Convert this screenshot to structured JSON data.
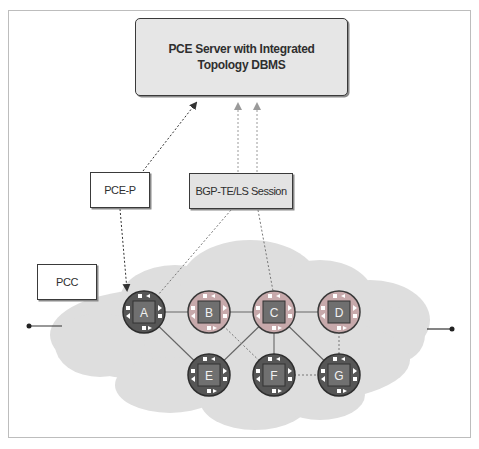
{
  "diagram": {
    "server": {
      "line1": "PCE Server with Integrated",
      "line2": "Topology DBMS"
    },
    "labels": {
      "pcep": "PCE-P",
      "bgp_session": "BGP-TE/LS Session",
      "pcc": "PCC"
    },
    "nodes": [
      {
        "id": "A",
        "label": "A",
        "style": "dark"
      },
      {
        "id": "B",
        "label": "B",
        "style": "light"
      },
      {
        "id": "C",
        "label": "C",
        "style": "light"
      },
      {
        "id": "D",
        "label": "D",
        "style": "light"
      },
      {
        "id": "E",
        "label": "E",
        "style": "dark"
      },
      {
        "id": "F",
        "label": "F",
        "style": "dark"
      },
      {
        "id": "G",
        "label": "G",
        "style": "dark"
      }
    ],
    "links_solid": [
      [
        "A",
        "B"
      ],
      [
        "B",
        "C"
      ],
      [
        "C",
        "D"
      ],
      [
        "A",
        "E"
      ],
      [
        "E",
        "C"
      ],
      [
        "C",
        "F"
      ],
      [
        "C",
        "G"
      ]
    ],
    "links_dotted": [
      [
        "B",
        "F"
      ],
      [
        "F",
        "G"
      ],
      [
        "D",
        "G"
      ]
    ],
    "signaling": [
      {
        "from": "PCE-P",
        "to": "PCE Server",
        "style": "dotted-arrow"
      },
      {
        "from": "PCE-P",
        "to": "A",
        "style": "dotted-arrow"
      },
      {
        "from": "BGP-TE/LS Session",
        "to": "PCE Server",
        "style": "dotted-arrow",
        "count": 2
      },
      {
        "from": "A",
        "to": "BGP-TE/LS Session",
        "style": "dotted"
      },
      {
        "from": "C",
        "to": "BGP-TE/LS Session",
        "style": "dotted"
      }
    ],
    "colors": {
      "frame": "#bdbdbd",
      "cloud": "#dcdcdc",
      "server_fill": "#e6e6e6",
      "bgp_fill": "#e3e3e3",
      "node_dark": "#555555",
      "node_light_ring": "#c9a8aa",
      "chip": "#6b6b6b",
      "line": "#555555"
    }
  }
}
